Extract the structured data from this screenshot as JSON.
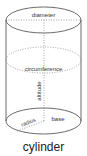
{
  "diagram": {
    "title": "cylinder",
    "labels": {
      "diameter": "diameter",
      "circumference": "circumference",
      "altitude": "altitude",
      "radius": "radius",
      "base": "base"
    },
    "colors": {
      "outline": "#6b6b6b",
      "dotted": "#8a8a8a",
      "text": "#333333",
      "background": "#ffffff"
    },
    "geometry": {
      "center_x": 43.5,
      "rx": 37.5,
      "ry": 13,
      "top_y": 20,
      "middle_y": 60,
      "bottom_y": 121
    }
  }
}
